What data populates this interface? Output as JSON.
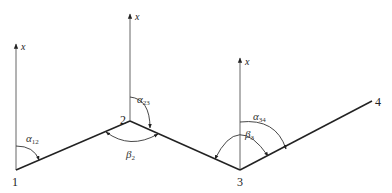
{
  "diagram": {
    "nodes": [
      {
        "id": "1",
        "label": "1",
        "x": 16,
        "y": 170
      },
      {
        "id": "2",
        "label": "2",
        "x": 130,
        "y": 121
      },
      {
        "id": "3",
        "label": "3",
        "x": 240,
        "y": 170
      },
      {
        "id": "4",
        "label": "4",
        "x": 372,
        "y": 101
      }
    ],
    "axes": [
      {
        "at": "1",
        "label": "x"
      },
      {
        "at": "2",
        "label": "x"
      },
      {
        "at": "3",
        "label": "x"
      }
    ],
    "angles": {
      "alpha12": {
        "sym": "α",
        "sub": "12"
      },
      "alpha23": {
        "sym": "α",
        "sub": "23"
      },
      "beta2": {
        "sym": "β",
        "sub": "2"
      },
      "beta3": {
        "sym": "β",
        "sub": "3"
      },
      "alpha34": {
        "sym": "α",
        "sub": "34"
      }
    }
  }
}
